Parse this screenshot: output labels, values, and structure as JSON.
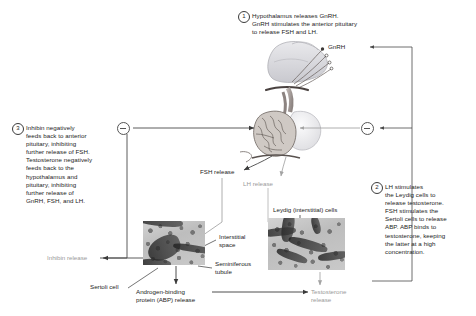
{
  "figure": {
    "background_color": "#ffffff",
    "line_color": "#4a4a4a",
    "faded_text_color": "#9a9a9a",
    "text_color": "#1c1c1c"
  },
  "steps": [
    {
      "number": "1",
      "text": "Hypothalamus releases GnRH.\nGnRH stimulates the anterior pituitary\nto release FSH and LH."
    },
    {
      "number": "2",
      "text": "LH stimulates\nthe Leydig cells to\nrelease testosterone.\nFSH stimulates the\nSertoli cells to release\nABP. ABP binds to\ntestosterone, keeping\nthe latter at a high\nconcentration."
    },
    {
      "number": "3",
      "text": "Inhibin negatively\nfeeds back to anterior\npituitary, inhibiting\nfurther release of FSH.\nTestosterone negatively\nfeeds back to the\nhypothalamus and\npituitary, inhibiting\nfurther release of\nGnRH, FSH, and LH."
    }
  ],
  "labels": {
    "gnrh": "GnRH",
    "fsh_release": "FSH release",
    "lh_release": "LH release",
    "leydig_cells": "Leydig (interstitial) cells",
    "interstitial_space": "Interstitial\nspace",
    "seminiferous_tubule": "Seminiferous\ntubule",
    "inhibin_release": "Inhibin release",
    "sertoli_cell": "Sertoli cell",
    "abp_release": "Androgen-binding\nprotein (ABP) release",
    "testosterone_release": "Testosterone\nrelease"
  },
  "feedback_nodes": [
    {
      "name": "inhibin-negative-feedback",
      "symbol": "−"
    },
    {
      "name": "testosterone-negative-feedback",
      "symbol": "−"
    }
  ],
  "illustration": {
    "hypothalamus_pituitary": "hypothalamus-pituitary-gland-illustration",
    "micrograph_left": "seminiferous-tubule-micrograph",
    "micrograph_right": "leydig-cells-micrograph"
  }
}
